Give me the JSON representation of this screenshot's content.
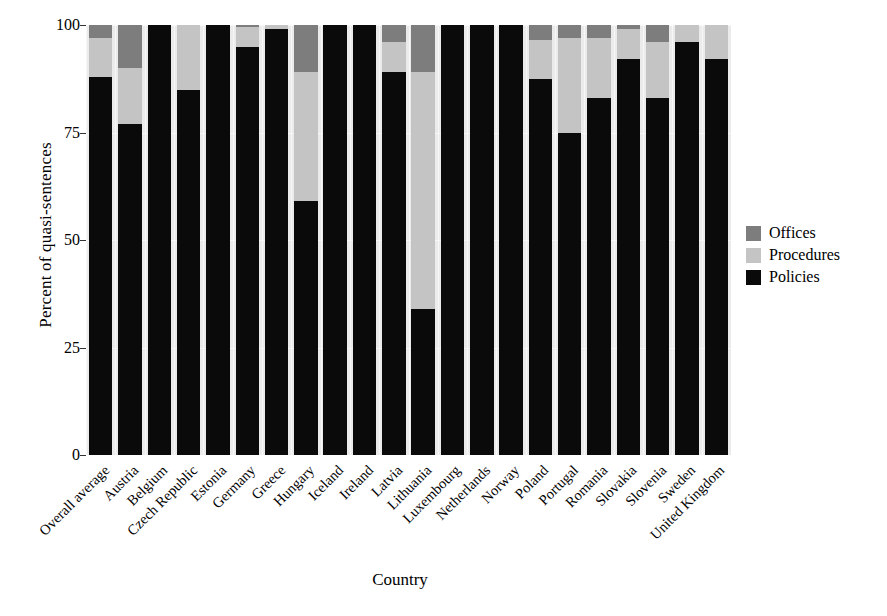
{
  "chart_data": {
    "type": "bar",
    "subtype": "stacked-percent",
    "title": "",
    "xlabel": "Country",
    "ylabel": "Percent of quasi-sentences",
    "ylim": [
      0,
      100
    ],
    "yticks": [
      0,
      25,
      50,
      75,
      100
    ],
    "grid": true,
    "legend_position": "right",
    "panel_background": "#ebebeb",
    "categories": [
      "Overall average",
      "Austria",
      "Belgium",
      "Czech Republic",
      "Estonia",
      "Germany",
      "Greece",
      "Hungary",
      "Iceland",
      "Ireland",
      "Latvia",
      "Lithuania",
      "Luxembourg",
      "Netherlands",
      "Norway",
      "Poland",
      "Portugal",
      "Romania",
      "Slovakia",
      "Slovenia",
      "Sweden",
      "United Kingdom"
    ],
    "series": [
      {
        "name": "Policies",
        "color": "#0a0a0a",
        "values": [
          88,
          77,
          100,
          85,
          100,
          95,
          99,
          59,
          100,
          100,
          89,
          34,
          100,
          100,
          100,
          87.5,
          75,
          83,
          92,
          83,
          96,
          92
        ]
      },
      {
        "name": "Procedures",
        "color": "#c4c4c4",
        "values": [
          9,
          13,
          0,
          15,
          0,
          4.5,
          1,
          30,
          0,
          0,
          7,
          55,
          0,
          0,
          0,
          9,
          22,
          14,
          7,
          13,
          4,
          8
        ]
      },
      {
        "name": "Offices",
        "color": "#7d7d7d",
        "values": [
          3,
          10,
          0,
          0,
          0,
          0.5,
          0,
          11,
          0,
          0,
          4,
          11,
          0,
          0,
          0,
          3.5,
          3,
          3,
          1,
          4,
          0,
          0
        ]
      }
    ],
    "legend": [
      {
        "label": "Offices",
        "color": "#7d7d7d"
      },
      {
        "label": "Procedures",
        "color": "#c4c4c4"
      },
      {
        "label": "Policies",
        "color": "#0a0a0a"
      }
    ]
  },
  "caption": {
    "text": ""
  }
}
